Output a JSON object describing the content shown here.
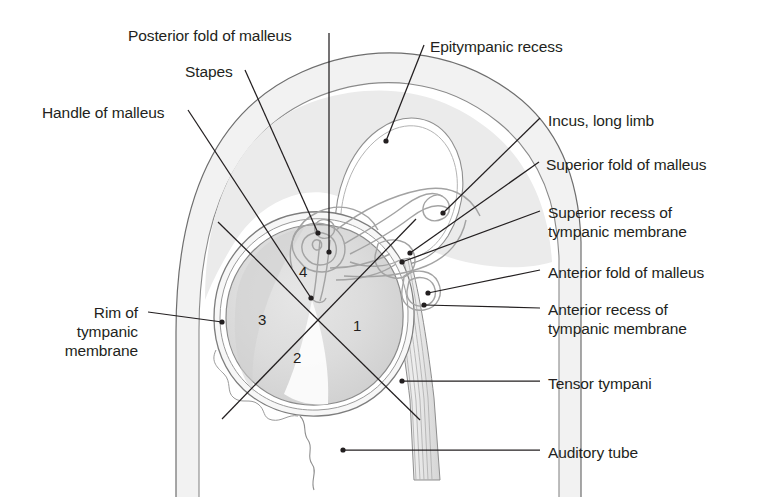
{
  "figure": {
    "background_color": "#ffffff",
    "outline_color": "#5a5a5a",
    "body_fill": "#f2f2f2",
    "membrane_fill": "#dcdcdc",
    "ossicle_color": "#a8a8a8",
    "leader_color": "#231f20",
    "text_color": "#231f20"
  },
  "labels": [
    {
      "id": "posterior-fold-of-malleus",
      "text": "Posterior fold of malleus",
      "x": 128,
      "y": 26,
      "align": "left"
    },
    {
      "id": "stapes",
      "text": "Stapes",
      "x": 185,
      "y": 62,
      "align": "left"
    },
    {
      "id": "handle-of-malleus",
      "text": "Handle of malleus",
      "x": 42,
      "y": 103,
      "align": "left"
    },
    {
      "id": "epitympanic-recess",
      "text": "Epitympanic recess",
      "x": 430,
      "y": 37,
      "align": "left"
    },
    {
      "id": "incus-long-limb",
      "text": "Incus, long limb",
      "x": 548,
      "y": 111,
      "align": "left"
    },
    {
      "id": "superior-fold-of-malleus",
      "text": "Superior fold of malleus",
      "x": 546,
      "y": 155,
      "align": "left"
    },
    {
      "id": "superior-recess-of-tympanic-membrane",
      "text": "Superior recess of\ntympanic membrane",
      "x": 548,
      "y": 203,
      "align": "left"
    },
    {
      "id": "anterior-fold-of-malleus",
      "text": "Anterior fold of malleus",
      "x": 548,
      "y": 263,
      "align": "left"
    },
    {
      "id": "anterior-recess-of-tympanic-membrane",
      "text": "Anterior recess of\ntympanic membrane",
      "x": 548,
      "y": 300,
      "align": "left"
    },
    {
      "id": "rim-of-tympanic-membrane",
      "text": "Rim of\ntympanic\nmembrane",
      "x": 18,
      "y": 303,
      "align": "right",
      "width": 120
    },
    {
      "id": "tensor-tympani",
      "text": "Tensor tympani",
      "x": 548,
      "y": 374,
      "align": "left"
    },
    {
      "id": "auditory-tube",
      "text": "Auditory tube",
      "x": 548,
      "y": 443,
      "align": "left"
    }
  ],
  "quadrant_numbers": [
    {
      "id": "quadrant-1",
      "text": "1",
      "x": 353,
      "y": 317
    },
    {
      "id": "quadrant-2",
      "text": "2",
      "x": 293,
      "y": 349
    },
    {
      "id": "quadrant-3",
      "text": "3",
      "x": 258,
      "y": 311
    },
    {
      "id": "quadrant-4",
      "text": "4",
      "x": 299,
      "y": 263
    }
  ],
  "leader_lines": [
    {
      "id": "leader-posterior-fold-of-malleus",
      "points": "329,33 329,252",
      "dot": "329,252"
    },
    {
      "id": "leader-stapes",
      "points": "245,70 318,233",
      "dot": "318,233"
    },
    {
      "id": "leader-handle-of-malleus",
      "points": "188,110 311,298",
      "dot": "311,298"
    },
    {
      "id": "leader-epitympanic-recess",
      "points": "424,45 386,141",
      "dot": "386,141"
    },
    {
      "id": "leader-incus-long-limb",
      "points": "540,118 443,213",
      "dot": "443,213"
    },
    {
      "id": "leader-superior-fold-of-malleus",
      "points": "539,162 410,253",
      "dot": "410,253"
    },
    {
      "id": "leader-superior-recess",
      "points": "540,211 402,262",
      "dot": "402,262"
    },
    {
      "id": "leader-anterior-fold-of-malleus",
      "points": "540,270 428,293",
      "dot": "428,293"
    },
    {
      "id": "leader-anterior-recess",
      "points": "540,308 424,305",
      "dot": "424,305"
    },
    {
      "id": "leader-rim-of-tympanic-membrane",
      "points": "148,312 222,322",
      "dot": "222,322"
    },
    {
      "id": "leader-tensor-tympani",
      "points": "540,381 402,381",
      "dot": "402,381"
    },
    {
      "id": "leader-auditory-tube",
      "points": "540,450 343,450",
      "dot": "343,450"
    }
  ]
}
